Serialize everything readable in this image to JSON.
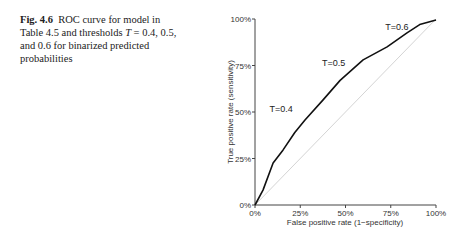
{
  "caption": {
    "fig_label": "Fig. 4.6",
    "text_before": "ROC curve for model in Table 4.5 and thresholds ",
    "var": "T",
    "text_after": " = 0.4, 0.5, and 0.6 for binarized predicted probabilities"
  },
  "chart_data": {
    "type": "line",
    "title": "",
    "xlabel": "False positive rate (1−specificity)",
    "ylabel": "True positive rate (sensitivity)",
    "xlim": [
      0,
      1
    ],
    "ylim": [
      0,
      1
    ],
    "x_ticks": [
      "0%",
      "25%",
      "50%",
      "75%",
      "100%"
    ],
    "y_ticks": [
      "0%",
      "25%",
      "50%",
      "75%",
      "100%"
    ],
    "grid": false,
    "legend": null,
    "series": [
      {
        "name": "ROC curve",
        "color": "#111111",
        "x": [
          0.0,
          0.044,
          0.1,
          0.155,
          0.22,
          0.276,
          0.376,
          0.47,
          0.597,
          0.73,
          0.84,
          0.91,
          1.0
        ],
        "y": [
          0.0,
          0.08,
          0.226,
          0.296,
          0.39,
          0.457,
          0.565,
          0.67,
          0.78,
          0.85,
          0.925,
          0.97,
          0.995
        ]
      },
      {
        "name": "Reference diagonal",
        "color": "#d4d4d4",
        "x": [
          0,
          1
        ],
        "y": [
          0,
          1
        ]
      }
    ],
    "annotations": [
      {
        "text": "T=0.4",
        "x": 0.08,
        "y": 0.5
      },
      {
        "text": "T=0.5",
        "x": 0.37,
        "y": 0.75
      },
      {
        "text": "T=0.6",
        "x": 0.72,
        "y": 0.94
      }
    ]
  }
}
